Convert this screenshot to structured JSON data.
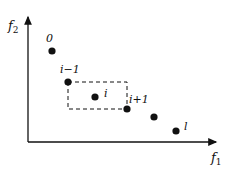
{
  "diagram": {
    "axes": {
      "x_label": "f",
      "x_sub": "1",
      "y_label": "f",
      "y_sub": "2"
    },
    "points": [
      {
        "id": "p0",
        "label": "0",
        "x": 52,
        "y": 51
      },
      {
        "id": "p-im1",
        "label": "i−1",
        "x": 68,
        "y": 82
      },
      {
        "id": "p-i",
        "label": "i",
        "x": 95,
        "y": 97
      },
      {
        "id": "p-ip1",
        "label": "i+1",
        "x": 127,
        "y": 109
      },
      {
        "id": "p-next",
        "label": "",
        "x": 154,
        "y": 117
      },
      {
        "id": "p-l",
        "label": "l",
        "x": 176,
        "y": 131
      }
    ],
    "cuboid": {
      "x1": 68,
      "y1": 82,
      "x2": 127,
      "y2": 109
    },
    "colors": {
      "ink": "#111111",
      "background": "#ffffff"
    }
  }
}
